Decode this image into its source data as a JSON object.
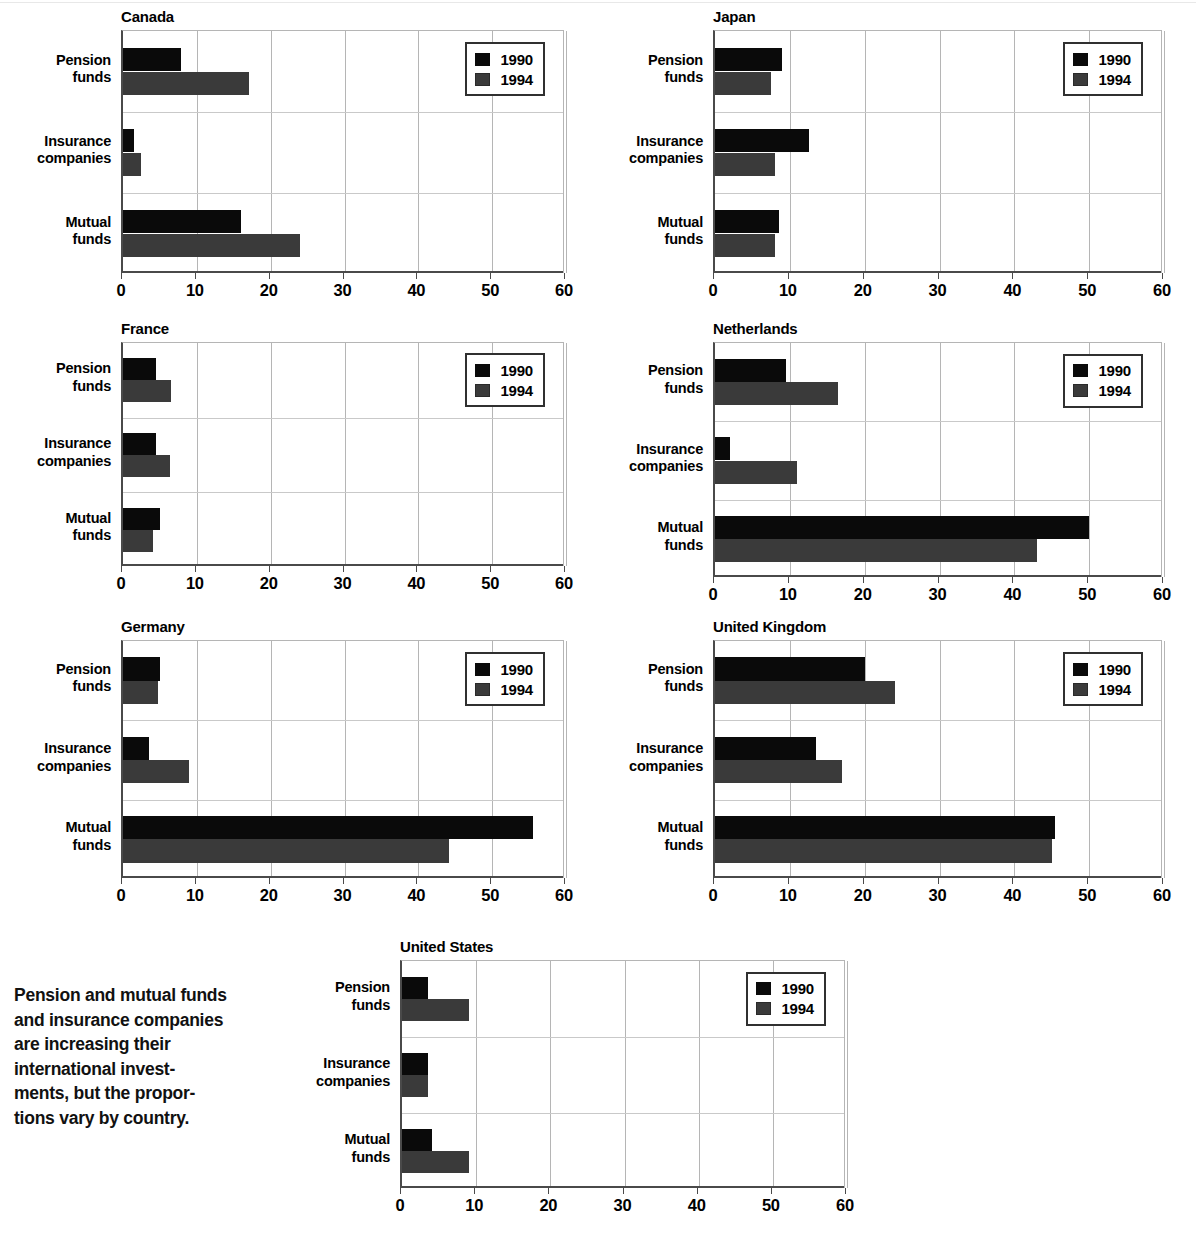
{
  "caption": "Pension and mutual funds and insurance companies are increasing their international invest- ments, but the propor- tions vary by country.",
  "legend": {
    "series_1_label": "1990",
    "series_2_label": "1994",
    "series_1_color": "#0a0a0a",
    "series_2_color": "#3a3a3a"
  },
  "categories": [
    "Pension funds",
    "Insurance companies",
    "Mutual funds"
  ],
  "category_lines": [
    [
      "Pension",
      "funds"
    ],
    [
      "Insurance",
      "companies"
    ],
    [
      "Mutual",
      "funds"
    ]
  ],
  "xticks": [
    "0",
    "10",
    "20",
    "30",
    "40",
    "50",
    "60"
  ],
  "chart_data": {
    "type": "bar",
    "orientation": "horizontal",
    "xlabel": "",
    "ylabel": "",
    "xlim": [
      0,
      60
    ],
    "xticks": [
      0,
      10,
      20,
      30,
      40,
      50,
      60
    ],
    "grid": "both",
    "legend_position": "upper right (inside each panel)",
    "legend_entries": [
      "1990",
      "1994"
    ],
    "categories": [
      "Pension funds",
      "Insurance companies",
      "Mutual funds"
    ],
    "panels": [
      {
        "title": "Canada",
        "series": [
          {
            "name": "1990",
            "values": [
              7.8,
              1.5,
              16.0
            ]
          },
          {
            "name": "1994",
            "values": [
              17.0,
              2.5,
              24.0
            ]
          }
        ]
      },
      {
        "title": "Japan",
        "series": [
          {
            "name": "1990",
            "values": [
              9.0,
              12.5,
              8.5
            ]
          },
          {
            "name": "1994",
            "values": [
              7.5,
              8.0,
              8.0
            ]
          }
        ]
      },
      {
        "title": "France",
        "series": [
          {
            "name": "1990",
            "values": [
              4.5,
              4.5,
              5.0
            ]
          },
          {
            "name": "1994",
            "values": [
              6.5,
              6.3,
              4.0
            ]
          }
        ]
      },
      {
        "title": "Netherlands",
        "series": [
          {
            "name": "1990",
            "values": [
              9.5,
              2.0,
              50.0
            ]
          },
          {
            "name": "1994",
            "values": [
              16.5,
              11.0,
              43.0
            ]
          }
        ]
      },
      {
        "title": "Germany",
        "series": [
          {
            "name": "1990",
            "values": [
              5.0,
              3.5,
              55.5
            ]
          },
          {
            "name": "1994",
            "values": [
              4.7,
              9.0,
              44.2
            ]
          }
        ]
      },
      {
        "title": "United Kingdom",
        "series": [
          {
            "name": "1990",
            "values": [
              20.0,
              13.5,
              45.5
            ]
          },
          {
            "name": "1994",
            "values": [
              24.0,
              17.0,
              45.0
            ]
          }
        ]
      },
      {
        "title": "United States",
        "series": [
          {
            "name": "1990",
            "values": [
              3.5,
              3.5,
              4.0
            ]
          },
          {
            "name": "1994",
            "values": [
              9.0,
              3.5,
              9.0
            ]
          }
        ]
      }
    ]
  }
}
